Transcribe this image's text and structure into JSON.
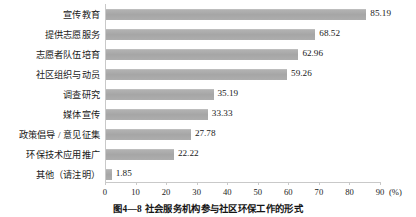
{
  "caption": "图4—8  社会服务机构参与社区环保工作的形式",
  "axis": {
    "unit_label": "(%)",
    "tick_labels": [
      "0",
      "10",
      "20",
      "30",
      "40",
      "50",
      "60",
      "70",
      "80",
      "90"
    ]
  },
  "colors": {
    "bar": "#a8a8a8",
    "axis": "#c9c9c9",
    "text": "#1a1a1a"
  },
  "chart_data": {
    "type": "bar",
    "orientation": "horizontal",
    "title": "图4—8  社会服务机构参与社区环保工作的形式",
    "xlabel": "(%)",
    "ylabel": "",
    "xlim": [
      0,
      90
    ],
    "xticks": [
      0,
      10,
      20,
      30,
      40,
      50,
      60,
      70,
      80,
      90
    ],
    "grid": false,
    "legend": false,
    "categories": [
      "宣传教育",
      "提供志愿服务",
      "志愿者队伍培育",
      "社区组织与动员",
      "调查研究",
      "媒体宣传",
      "政策倡导 / 意见征集",
      "环保技术应用推广",
      "其他（请注明）"
    ],
    "values": [
      85.19,
      68.52,
      62.96,
      59.26,
      35.19,
      33.33,
      27.78,
      22.22,
      1.85
    ],
    "value_labels": [
      "85.19",
      "68.52",
      "62.96",
      "59.26",
      "35.19",
      "33.33",
      "27.78",
      "22.22",
      "1.85"
    ]
  }
}
